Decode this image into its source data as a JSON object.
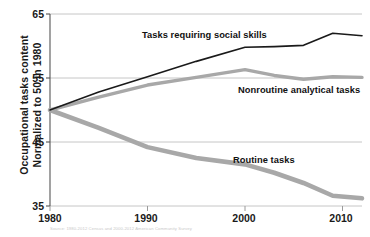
{
  "chart_data": {
    "type": "line",
    "title": "",
    "xlabel": "",
    "ylabel": "Occupational tasks content\nNormalized to 50 in 1980",
    "ylabel_line1": "Occupational tasks content",
    "ylabel_line2": "Normalized to 50 in 1980",
    "xlim": [
      1980,
      2012
    ],
    "ylim": [
      35,
      65
    ],
    "yticks": [
      65,
      55,
      45,
      35
    ],
    "ytick_labels": [
      "65",
      "55",
      "45",
      "35"
    ],
    "xticks": [
      1980,
      1990,
      2000,
      2010
    ],
    "xtick_labels": [
      "1980",
      "1990",
      "2000",
      "2010"
    ],
    "grid": "horizontal",
    "legend_position": "inline-annotations",
    "series": [
      {
        "name": "Tasks requiring social skills",
        "color": "#1a1a1a",
        "width": 1.6,
        "x": [
          1980,
          1985,
          1990,
          1995,
          2000,
          2003,
          2006,
          2009,
          2012
        ],
        "values": [
          50.0,
          52.8,
          55.2,
          57.6,
          59.8,
          59.9,
          60.1,
          62.0,
          61.6
        ]
      },
      {
        "name": "Nonroutine analytical tasks",
        "color": "#a8a8a8",
        "width": 3.4,
        "x": [
          1980,
          1985,
          1990,
          1995,
          2000,
          2003,
          2006,
          2009,
          2012
        ],
        "values": [
          50.0,
          52.0,
          53.9,
          55.1,
          56.3,
          55.4,
          54.8,
          55.2,
          55.1
        ]
      },
      {
        "name": "Routine tasks",
        "color": "#a8a8a8",
        "width": 4.6,
        "x": [
          1980,
          1985,
          1990,
          1995,
          2000,
          2003,
          2006,
          2009,
          2012
        ],
        "values": [
          50.0,
          47.2,
          44.2,
          42.5,
          41.5,
          40.2,
          38.6,
          36.6,
          36.2
        ]
      }
    ],
    "annotations": [
      {
        "text": "Tasks requiring social skills",
        "x": 1990.0,
        "y": 62.3
      },
      {
        "text": "Nonroutine analytical tasks",
        "x": 2001.5,
        "y": 52.9
      },
      {
        "text": "Routine tasks",
        "x": 2000.0,
        "y": 43.0
      }
    ]
  },
  "footnote": "Source: 1980-2012 Census and 2000-2012 American Community Survey"
}
